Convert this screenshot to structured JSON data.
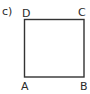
{
  "figure": {
    "part_label": "c)",
    "shape": "square",
    "vertices": {
      "top_left": "D",
      "top_right": "C",
      "bottom_left": "A",
      "bottom_right": "B"
    },
    "stroke_color": "#333333"
  }
}
